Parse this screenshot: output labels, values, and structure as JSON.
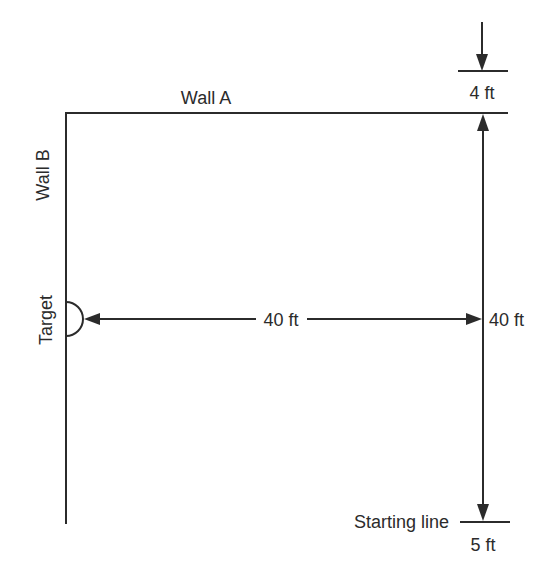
{
  "diagram": {
    "title": "",
    "labels": {
      "wall_a": "Wall A",
      "wall_b": "Wall B",
      "target": "Target",
      "horizontal_distance": "40 ft",
      "vertical_distance": "40 ft",
      "top_offset": "4 ft",
      "bottom_offset": "5 ft",
      "starting_line": "Starting line"
    },
    "elements": [
      {
        "id": "wall-a",
        "type": "line",
        "label": "Wall A"
      },
      {
        "id": "wall-b",
        "type": "line",
        "label": "Wall B"
      },
      {
        "id": "target",
        "type": "semicircle",
        "label": "Target"
      },
      {
        "id": "starting-line",
        "type": "line",
        "label": "Starting line"
      },
      {
        "id": "dim-horizontal",
        "type": "double-arrow",
        "from": "target",
        "to": "vertical-dimension",
        "value": "40 ft"
      },
      {
        "id": "dim-vertical",
        "type": "double-arrow",
        "from": "wall-a",
        "to": "starting-line",
        "value": "40 ft"
      },
      {
        "id": "dim-top-offset",
        "type": "dimension",
        "value": "4 ft"
      },
      {
        "id": "dim-bottom-offset",
        "type": "dimension",
        "value": "5 ft"
      }
    ],
    "colors": {
      "ink": "#2b2b2b",
      "background": "#ffffff"
    }
  }
}
